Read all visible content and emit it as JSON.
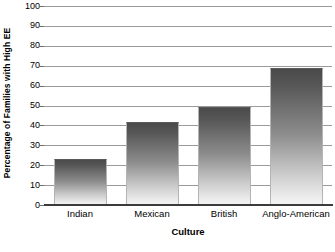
{
  "chart_data": {
    "type": "bar",
    "title": "",
    "categories": [
      "Indian",
      "Mexican",
      "British",
      "Anglo-American"
    ],
    "values": [
      23,
      41.5,
      49.5,
      69
    ],
    "xlabel": "Culture",
    "ylabel": "Percentage of Families with High EE",
    "ylim": [
      0,
      100
    ],
    "ytick_step": 10,
    "yticks": [
      "100",
      "90",
      "80",
      "70",
      "60",
      "50",
      "40",
      "30",
      "20",
      "10",
      "0"
    ],
    "grid": true,
    "legend": null,
    "colors": {
      "bar_top": "#4a4a4a",
      "bar_bottom": "#f4f4f4",
      "bar_border": "#b4b4b4",
      "gridline": "#9a9a9a",
      "axis": "#3b3b3b",
      "background": "#ffffff",
      "text": "#000000"
    }
  }
}
